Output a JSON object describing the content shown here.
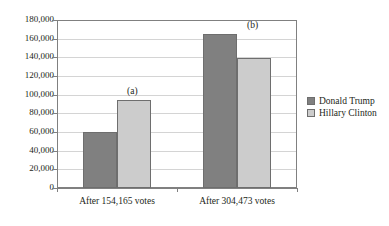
{
  "chart_data": {
    "type": "bar",
    "title": "",
    "subtitle": "",
    "xlabel": "",
    "ylabel": "",
    "grid": true,
    "legend_position": "right",
    "categories": [
      "After 154,165 votes",
      "After 304,473 votes"
    ],
    "series": [
      {
        "name": "Donald Trump",
        "color": "#808080",
        "values": [
          60000,
          166000
        ]
      },
      {
        "name": "Hillary Clinton",
        "color": "#cccccc",
        "values": [
          95000,
          140000
        ]
      }
    ],
    "ylim": [
      0,
      180000
    ],
    "ytick_step": 20000,
    "ytick_labels": [
      "0",
      "20,000",
      "40,000",
      "60,000",
      "80,000",
      "100,000",
      "120,000",
      "140,000",
      "160,000",
      "180,000"
    ],
    "annotations": [
      {
        "text": "(a)",
        "group_index": 0
      },
      {
        "text": "(b)",
        "group_index": 1
      }
    ]
  },
  "legend": {
    "items": [
      {
        "label": "Donald Trump"
      },
      {
        "label": "Hillary Clinton"
      }
    ]
  }
}
